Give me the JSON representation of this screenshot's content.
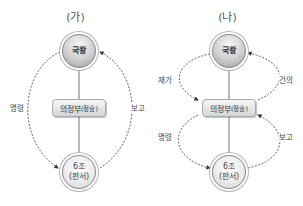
{
  "diagrams": [
    {
      "title": "(가)",
      "nodes": {
        "king": "국왕",
        "council": "의정부",
        "council_sub": "(정승)",
        "six_line1": "6조",
        "six_line2": "(판서)"
      },
      "edges": {
        "left": "명령",
        "right": "보고"
      }
    },
    {
      "title": "(나)",
      "nodes": {
        "king": "국왕",
        "council": "의정부",
        "council_sub": "(정승)",
        "six_line1": "6조",
        "six_line2": "(판서)"
      },
      "edges": {
        "upper_left": "재가",
        "upper_right": "건의",
        "lower_left": "명령",
        "lower_right": "보고"
      }
    }
  ],
  "colors": {
    "line": "#8a8a8a",
    "dashed": "#555555"
  }
}
